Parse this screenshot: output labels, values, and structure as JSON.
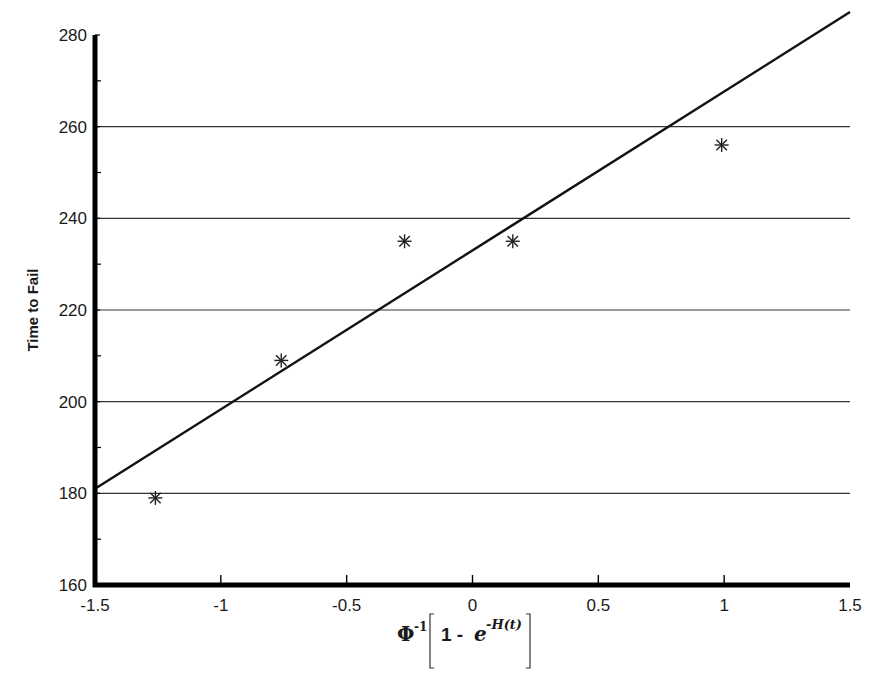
{
  "chart_data": {
    "type": "scatter",
    "title": "",
    "xlabel": "Φ⁻¹[1 - e^(-H(t))]",
    "xlabel_parts": {
      "phi": "Φ",
      "sup": "-1",
      "one_minus": "1 - ",
      "e": "e",
      "exp": "-H(t)"
    },
    "ylabel": "Time to Fail",
    "xlim": [
      -1.5,
      1.5
    ],
    "ylim": [
      160,
      280
    ],
    "x_ticks": [
      -1.5,
      -1,
      -0.5,
      0,
      0.5,
      1,
      1.5
    ],
    "x_tick_labels": [
      "-1.5",
      "-1",
      "-0.5",
      "0",
      "0.5",
      "1",
      "1.5"
    ],
    "y_ticks": [
      160,
      180,
      200,
      220,
      240,
      260,
      280
    ],
    "y_tick_labels": [
      "160",
      "180",
      "200",
      "220",
      "240",
      "260",
      "280"
    ],
    "y_minor_ticks": [
      170,
      190,
      210,
      230,
      250,
      270
    ],
    "x_minor_ticks": [],
    "grid": {
      "horizontal": true,
      "vertical": false,
      "lines_at": [
        180,
        200,
        220,
        240,
        260
      ]
    },
    "legend": null,
    "series": [
      {
        "name": "Observed",
        "marker": "asterisk",
        "points": [
          {
            "x": -1.26,
            "y": 179
          },
          {
            "x": -0.76,
            "y": 209
          },
          {
            "x": -0.27,
            "y": 235
          },
          {
            "x": 0.16,
            "y": 235
          },
          {
            "x": 0.99,
            "y": 256
          }
        ]
      },
      {
        "name": "Fitted line",
        "type": "line",
        "points": [
          {
            "x": -1.5,
            "y": 181
          },
          {
            "x": 1.5,
            "y": 285
          }
        ]
      }
    ]
  }
}
